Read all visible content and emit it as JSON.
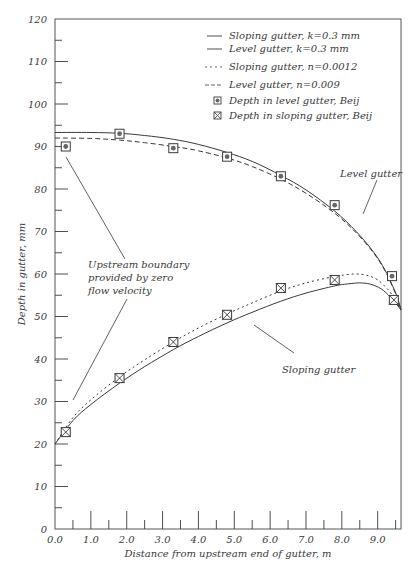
{
  "chart_data": {
    "type": "line",
    "title": "",
    "xlabel": "Distance from upstream end of gutter, m",
    "ylabel": "Depth in gutter, mm",
    "xlim": [
      0,
      9.65
    ],
    "ylim": [
      0,
      120
    ],
    "x_ticks": [
      "0.0",
      "1.0",
      "2.0",
      "3.0",
      "4.0",
      "5.0",
      "6.0",
      "7.0",
      "8.0",
      "9.0"
    ],
    "x_tick_values": [
      0,
      1,
      2,
      3,
      4,
      5,
      6,
      7,
      8,
      9
    ],
    "x_minor_ticks": [
      0.5,
      1.5,
      2.5,
      3.5,
      4.5,
      5.5,
      6.5,
      7.5,
      8.5,
      9.5
    ],
    "y_ticks": [
      "0",
      "10",
      "20",
      "30",
      "40",
      "50",
      "60",
      "70",
      "80",
      "90",
      "100",
      "110",
      "120"
    ],
    "y_tick_values": [
      0,
      10,
      20,
      30,
      40,
      50,
      60,
      70,
      80,
      90,
      100,
      110,
      120
    ],
    "y_minor_ticks": [
      5,
      15,
      25,
      35,
      45,
      55,
      65,
      75,
      85,
      95,
      105,
      115
    ],
    "grid": false,
    "legend_position": "upper right",
    "series": [
      {
        "name": "Sloping gutter, k=0.3 mm",
        "style": "solid",
        "kind": "line",
        "x": [
          0,
          0.5,
          1.0,
          1.8,
          2.5,
          3.3,
          4.0,
          4.8,
          5.5,
          6.3,
          7.0,
          7.8,
          8.2,
          8.5,
          8.8,
          9.1,
          9.35,
          9.5,
          9.65
        ],
        "y": [
          20,
          25.5,
          29.3,
          34.3,
          38.2,
          42.2,
          45.3,
          48.5,
          51.0,
          53.6,
          55.5,
          57.2,
          57.7,
          57.9,
          57.6,
          56.5,
          54.6,
          53.2,
          51.5
        ]
      },
      {
        "name": "Level gutter, k=0.3 mm",
        "style": "solid",
        "kind": "line",
        "x": [
          0,
          1.0,
          1.8,
          2.5,
          3.3,
          4.0,
          4.8,
          5.5,
          6.3,
          7.0,
          7.8,
          8.4,
          8.9,
          9.2,
          9.4,
          9.55,
          9.65
        ],
        "y": [
          93.3,
          93.3,
          93.1,
          92.6,
          91.7,
          90.5,
          88.6,
          86.5,
          83.2,
          79.8,
          74.8,
          70.0,
          65.0,
          61.0,
          57.5,
          54.5,
          51.5
        ]
      },
      {
        "name": "Sloping gutter, n=0.0012",
        "style": "dotted",
        "kind": "line",
        "x": [
          0,
          0.5,
          1.0,
          1.8,
          2.5,
          3.3,
          4.0,
          4.8,
          5.5,
          6.3,
          7.0,
          7.8,
          8.35,
          8.7,
          9.0,
          9.3,
          9.5,
          9.65
        ],
        "y": [
          20,
          26.2,
          30.4,
          35.8,
          39.8,
          44.0,
          47.3,
          50.6,
          53.2,
          56.0,
          57.9,
          59.4,
          60.0,
          59.7,
          58.6,
          56.2,
          53.8,
          51.5
        ]
      },
      {
        "name": "Level gutter, n=0.009",
        "style": "dashed",
        "kind": "line",
        "x": [
          0,
          1.0,
          1.8,
          2.5,
          3.3,
          4.0,
          4.8,
          5.5,
          6.3,
          7.0,
          7.8,
          8.4,
          8.9,
          9.2,
          9.4,
          9.55,
          9.65
        ],
        "y": [
          92.0,
          91.9,
          91.5,
          90.9,
          90.0,
          89.0,
          87.3,
          85.3,
          82.3,
          79.0,
          74.3,
          69.7,
          64.8,
          60.8,
          57.3,
          54.3,
          51.5
        ]
      },
      {
        "name": "Depth in level gutter, Beij",
        "style": "marker-dot-square",
        "kind": "scatter",
        "x": [
          0.3,
          1.8,
          3.3,
          4.8,
          6.3,
          7.8,
          9.4
        ],
        "y": [
          90.0,
          93.0,
          89.6,
          87.6,
          83.0,
          76.2,
          59.5
        ]
      },
      {
        "name": "Depth in sloping gutter, Beij",
        "style": "marker-x-square",
        "kind": "scatter",
        "x": [
          0.3,
          1.8,
          3.3,
          4.8,
          6.3,
          7.8,
          9.45
        ],
        "y": [
          22.8,
          35.5,
          44.0,
          50.4,
          56.7,
          58.6,
          53.9
        ]
      }
    ],
    "annotations": [
      {
        "text": [
          "Upstream boundary",
          "provided by zero",
          "flow velocity"
        ]
      },
      {
        "text": [
          "Level gutter"
        ]
      },
      {
        "text": [
          "Sloping gutter"
        ]
      }
    ]
  },
  "legend": {
    "items": [
      {
        "label": "Sloping gutter, k=0.3 mm",
        "symbol": "solid"
      },
      {
        "label": "Level gutter, k=0.3 mm",
        "symbol": "solid"
      },
      {
        "label": "Sloping gutter, n=0.0012",
        "symbol": "dotted"
      },
      {
        "label": "Level gutter, n=0.009",
        "symbol": "dashed"
      },
      {
        "label": "Depth in level gutter, Beij",
        "symbol": "dot-square"
      },
      {
        "label": "Depth in sloping gutter, Beij",
        "symbol": "x-square"
      }
    ]
  },
  "annotations": {
    "upstream": [
      "Upstream boundary",
      "provided by zero",
      "flow velocity"
    ],
    "level": "Level gutter",
    "sloping": "Sloping gutter"
  },
  "axes": {
    "xlabel": "Distance from upstream end of gutter, m",
    "ylabel": "Depth in gutter, mm"
  },
  "colors": {
    "line": "#3a3a3a",
    "frame": "#555555",
    "marker_fill": "#666666"
  }
}
